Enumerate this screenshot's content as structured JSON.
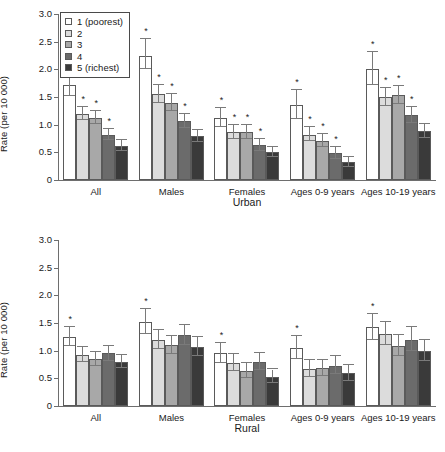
{
  "chart_data": [
    {
      "type": "bar",
      "title": "Urban",
      "panel": "urban",
      "xlabel": "Urban",
      "ylabel": "Rate (per 10 000)",
      "ylim": [
        0,
        3.0
      ],
      "yticks": [
        "0",
        "0.5",
        "1.0",
        "1.5",
        "2.0",
        "2.5",
        "3.0"
      ],
      "ytick_values": [
        0,
        0.5,
        1.0,
        1.5,
        2.0,
        2.5,
        3.0
      ],
      "grid": false,
      "legend_position": "top-left",
      "categories": [
        "All",
        "Males",
        "Females",
        "Ages 0-9 years",
        "Ages 10-19 years"
      ],
      "series": [
        {
          "name": "1 (poorest)",
          "color": "#ffffff",
          "values": [
            1.72,
            2.25,
            1.12,
            1.35,
            2.0
          ],
          "err_low": [
            1.52,
            2.0,
            0.95,
            1.1,
            1.72
          ],
          "err_high": [
            1.92,
            2.55,
            1.3,
            1.62,
            2.32
          ],
          "significant": [
            true,
            true,
            true,
            true,
            true
          ]
        },
        {
          "name": "2",
          "color": "#dcdcdc",
          "values": [
            1.2,
            1.55,
            0.86,
            0.82,
            1.5
          ],
          "err_low": [
            1.08,
            1.4,
            0.74,
            0.7,
            1.34
          ],
          "err_high": [
            1.32,
            1.72,
            0.99,
            0.95,
            1.67
          ],
          "significant": [
            true,
            true,
            true,
            true,
            true
          ]
        },
        {
          "name": "3",
          "color": "#a8a8a8",
          "values": [
            1.12,
            1.4,
            0.87,
            0.7,
            1.53
          ],
          "err_low": [
            1.01,
            1.25,
            0.75,
            0.59,
            1.37
          ],
          "err_high": [
            1.24,
            1.55,
            1.0,
            0.83,
            1.7
          ],
          "significant": [
            true,
            true,
            true,
            true,
            true
          ]
        },
        {
          "name": "4",
          "color": "#6b6b6b",
          "values": [
            0.82,
            1.07,
            0.63,
            0.48,
            1.17
          ],
          "err_low": [
            0.72,
            0.94,
            0.53,
            0.38,
            1.03
          ],
          "err_high": [
            0.93,
            1.2,
            0.74,
            0.59,
            1.32
          ],
          "significant": [
            true,
            true,
            true,
            true,
            true
          ]
        },
        {
          "name": "5 (richest)",
          "color": "#3a3a3a",
          "values": [
            0.62,
            0.79,
            0.5,
            0.32,
            0.88
          ],
          "err_low": [
            0.53,
            0.68,
            0.41,
            0.24,
            0.76
          ],
          "err_high": [
            0.72,
            0.9,
            0.6,
            0.42,
            1.01
          ],
          "significant": [
            false,
            false,
            false,
            false,
            false
          ]
        }
      ]
    },
    {
      "type": "bar",
      "title": "Rural",
      "panel": "rural",
      "xlabel": "Rural",
      "ylabel": "Rate (per 10 000)",
      "ylim": [
        0,
        3.0
      ],
      "yticks": [
        "0",
        "0.5",
        "1.0",
        "1.5",
        "2.0",
        "2.5",
        "3.0"
      ],
      "ytick_values": [
        0,
        0.5,
        1.0,
        1.5,
        2.0,
        2.5,
        3.0
      ],
      "grid": false,
      "legend_position": "none",
      "categories": [
        "All",
        "Males",
        "Females",
        "Ages 0-9 years",
        "Ages 10-19 years"
      ],
      "series": [
        {
          "name": "1 (poorest)",
          "color": "#ffffff",
          "values": [
            1.25,
            1.52,
            0.95,
            1.05,
            1.42
          ],
          "err_low": [
            1.08,
            1.3,
            0.78,
            0.85,
            1.2
          ],
          "err_high": [
            1.42,
            1.76,
            1.14,
            1.27,
            1.66
          ],
          "significant": [
            true,
            true,
            true,
            true,
            true
          ]
        },
        {
          "name": "2",
          "color": "#dcdcdc",
          "values": [
            0.93,
            1.2,
            0.78,
            0.67,
            1.3
          ],
          "err_low": [
            0.8,
            1.03,
            0.64,
            0.53,
            1.1
          ],
          "err_high": [
            1.07,
            1.38,
            0.94,
            0.83,
            1.52
          ],
          "significant": [
            false,
            false,
            false,
            false,
            false
          ]
        },
        {
          "name": "3",
          "color": "#a8a8a8",
          "values": [
            0.85,
            1.1,
            0.63,
            0.68,
            1.08
          ],
          "err_low": [
            0.73,
            0.94,
            0.5,
            0.54,
            0.9
          ],
          "err_high": [
            0.98,
            1.27,
            0.77,
            0.84,
            1.28
          ],
          "significant": [
            false,
            false,
            false,
            false,
            false
          ]
        },
        {
          "name": "4",
          "color": "#6b6b6b",
          "values": [
            0.95,
            1.28,
            0.8,
            0.73,
            1.2
          ],
          "err_low": [
            0.82,
            1.1,
            0.65,
            0.58,
            1.0
          ],
          "err_high": [
            1.09,
            1.47,
            0.96,
            0.9,
            1.42
          ],
          "significant": [
            false,
            false,
            false,
            false,
            false
          ]
        },
        {
          "name": "5 (richest)",
          "color": "#3a3a3a",
          "values": [
            0.8,
            1.07,
            0.53,
            0.6,
            1.0
          ],
          "err_low": [
            0.68,
            0.9,
            0.42,
            0.46,
            0.82
          ],
          "err_high": [
            0.93,
            1.25,
            0.66,
            0.75,
            1.2
          ],
          "significant": [
            false,
            false,
            false,
            false,
            false
          ]
        }
      ]
    }
  ],
  "legend": {
    "items": [
      {
        "label": "1 (poorest)",
        "color": "#ffffff"
      },
      {
        "label": "2",
        "color": "#dcdcdc"
      },
      {
        "label": "3",
        "color": "#a8a8a8"
      },
      {
        "label": "4",
        "color": "#6b6b6b"
      },
      {
        "label": "5 (richest)",
        "color": "#3a3a3a"
      }
    ]
  },
  "significance_marker": "*"
}
